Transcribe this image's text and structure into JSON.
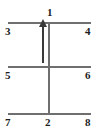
{
  "diagram": {
    "type": "energy-level-transition-diagram",
    "background_color": "#ffffff",
    "line_color": "#6f6f6f",
    "arrow_color": "#3a3a3a",
    "label_color": "#1c1c1c",
    "labels": {
      "top_center": "1",
      "bottom_center": "2",
      "top_left": "3",
      "top_right": "4",
      "middle_left": "5",
      "middle_right": "6",
      "bottom_left": "7",
      "bottom_right": "8"
    },
    "levels": [
      {
        "name": "top-level",
        "y": 22,
        "x_start": 8,
        "x_end": 91
      },
      {
        "name": "middle-level",
        "y": 66,
        "x_start": 8,
        "x_end": 91
      },
      {
        "name": "bottom-level",
        "y": 113,
        "x_start": 8,
        "x_end": 91
      }
    ],
    "vertical_connector": {
      "x": 48,
      "y_start": 22,
      "y_end": 113
    },
    "arrow": {
      "x": 43,
      "y_tail": 62,
      "y_tip": 22,
      "direction": "up"
    }
  }
}
